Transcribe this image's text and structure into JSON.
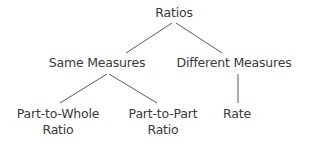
{
  "diagram": {
    "type": "tree",
    "line_color": "#5a5a5a",
    "text_color": "#3a3a3a",
    "nodes": {
      "root": {
        "label": "Ratios"
      },
      "same": {
        "label": "Same Measures"
      },
      "different": {
        "label": "Different Measures"
      },
      "part_to_whole": {
        "line1": "Part-to-Whole",
        "line2": "Ratio"
      },
      "part_to_part": {
        "line1": "Part-to-Part",
        "line2": "Ratio"
      },
      "rate": {
        "label": "Rate"
      }
    },
    "edges": [
      {
        "from": "Ratios",
        "to": "Same Measures"
      },
      {
        "from": "Ratios",
        "to": "Different Measures"
      },
      {
        "from": "Same Measures",
        "to": "Part-to-Whole Ratio"
      },
      {
        "from": "Same Measures",
        "to": "Part-to-Part Ratio"
      },
      {
        "from": "Different Measures",
        "to": "Rate"
      }
    ]
  }
}
